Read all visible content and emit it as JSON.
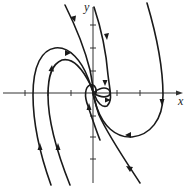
{
  "figure": {
    "type": "phase-portrait",
    "axes": {
      "x_label": "x",
      "y_label": "y",
      "x_ticks_count_left": 3,
      "x_ticks_count_right": 2,
      "y_ticks_count_up": 3,
      "y_ticks_count_down": 3
    },
    "colors": {
      "curve": "#1a1a1a",
      "axis": "#333333",
      "background": "#ffffff"
    },
    "trajectories": [
      {
        "name": "upper-right-outer",
        "arrows": 2
      },
      {
        "name": "top-diagonal",
        "arrows": 1
      },
      {
        "name": "top-near-axis",
        "arrows": 2
      },
      {
        "name": "left-outer",
        "arrows": 2
      },
      {
        "name": "left-inner",
        "arrows": 2
      },
      {
        "name": "center-loop",
        "arrows": 1
      },
      {
        "name": "bottom-diagonal",
        "arrows": 1
      }
    ]
  }
}
